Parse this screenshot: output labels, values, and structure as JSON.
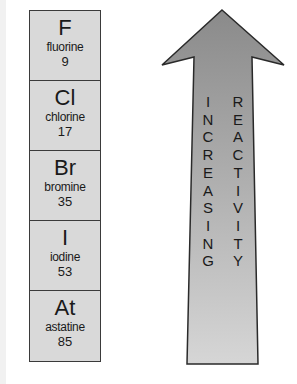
{
  "elements": [
    {
      "symbol": "F",
      "name": "fluorine",
      "number": "9"
    },
    {
      "symbol": "Cl",
      "name": "chlorine",
      "number": "17"
    },
    {
      "symbol": "Br",
      "name": "bromine",
      "number": "35"
    },
    {
      "symbol": "I",
      "name": "iodine",
      "number": "53"
    },
    {
      "symbol": "At",
      "name": "astatine",
      "number": "85"
    }
  ],
  "arrow": {
    "word1": [
      "I",
      "N",
      "C",
      "R",
      "E",
      "A",
      "S",
      "I",
      "N",
      "G"
    ],
    "word2": [
      "R",
      "E",
      "A",
      "C",
      "T",
      "I",
      "V",
      "I",
      "T",
      "Y"
    ],
    "label": "INCREASING REACTIVITY",
    "color_top": "#8a8a8a",
    "color_bottom": "#d4d4d4"
  }
}
